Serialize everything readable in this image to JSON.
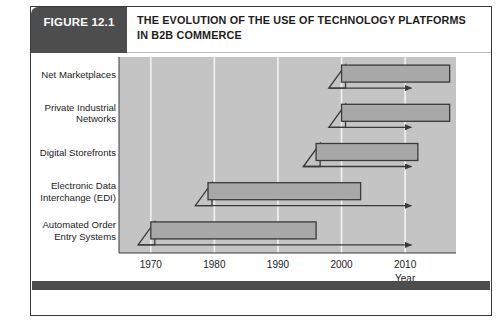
{
  "figure": {
    "tab_label": "FIGURE 12.1",
    "title_line1": "THE EVOLUTION OF THE USE OF TECHNOLOGY PLATFORMS",
    "title_line2": "IN B2B COMMERCE"
  },
  "colors": {
    "tab_background": "#4d4d4d",
    "tab_text": "#ffffff",
    "title_text": "#1d1d1d",
    "plot_background": "#c4c4c4",
    "bar_fill": "#a8a8a8",
    "bar_stroke": "#3a3a3a",
    "gridline": "#f2f2f2",
    "axis_line": "#3a3a3a",
    "footer_rule": "#4d4d4d",
    "card_border": "#3a3a3a"
  },
  "chart_data": {
    "type": "bar",
    "title": "THE EVOLUTION OF THE USE OF TECHNOLOGY PLATFORMS IN B2B COMMERCE",
    "xlabel": "Year",
    "ylabel": "",
    "orientation": "horizontal",
    "grid": true,
    "legend": "none",
    "xlim": [
      1965,
      2018
    ],
    "xticks": [
      1970,
      1980,
      1990,
      2000,
      2010
    ],
    "xtick_labels": [
      "1970",
      "1980",
      "1990",
      "2000",
      "2010"
    ],
    "categories": [
      "Net Marketplaces",
      "Private Industrial Networks",
      "Digital Storefronts",
      "Electronic Data Interchange (EDI)",
      "Automated Order Entry Systems"
    ],
    "bars": [
      {
        "label": "Net Marketplaces",
        "label_line1": "Net Marketplaces",
        "label_line2": "",
        "start": 2000,
        "end": 2017,
        "arrow_end": 2011,
        "ramp_start": 1998
      },
      {
        "label": "Private Industrial Networks",
        "label_line1": "Private Industrial",
        "label_line2": "Networks",
        "start": 2000,
        "end": 2017,
        "arrow_end": 2011,
        "ramp_start": 1998
      },
      {
        "label": "Digital Storefronts",
        "label_line1": "Digital Storefronts",
        "label_line2": "",
        "start": 1996,
        "end": 2012,
        "arrow_end": 2011,
        "ramp_start": 1994
      },
      {
        "label": "Electronic Data Interchange (EDI)",
        "label_line1": "Electronic Data",
        "label_line2": "Interchange (EDI)",
        "start": 1979,
        "end": 2003,
        "arrow_end": 2011,
        "ramp_start": 1977
      },
      {
        "label": "Automated Order Entry Systems",
        "label_line1": "Automated Order",
        "label_line2": "Entry Systems",
        "start": 1970,
        "end": 1996,
        "arrow_end": 2011,
        "ramp_start": 1968
      }
    ]
  }
}
